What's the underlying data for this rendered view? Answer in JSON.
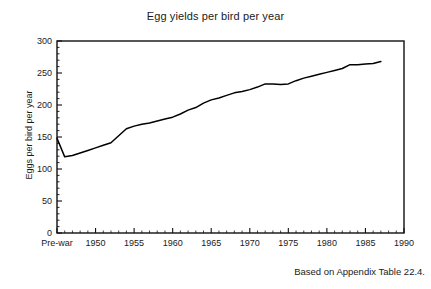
{
  "chart_data": {
    "type": "line",
    "title": "Egg yields per bird per year",
    "xlabel": "",
    "ylabel": "Eggs per bird per year",
    "source_note": "Based on Appendix Table 22.4.",
    "xlim": [
      1945,
      1990
    ],
    "ylim": [
      0,
      300
    ],
    "y_ticks": [
      0,
      50,
      100,
      150,
      200,
      250,
      300
    ],
    "y_minor_tick_step": 10,
    "x_ticks": [
      1945,
      1950,
      1955,
      1960,
      1965,
      1970,
      1975,
      1980,
      1985,
      1990
    ],
    "x_tick_labels": [
      "Pre-war",
      "1950",
      "1955",
      "1960",
      "1965",
      "1970",
      "1975",
      "1980",
      "1985",
      "1990"
    ],
    "x_minor_tick_step": 1,
    "grid": false,
    "legend": false,
    "series": [
      {
        "name": "Egg yield",
        "color": "#000000",
        "x": [
          1945,
          1946,
          1947,
          1948,
          1949,
          1950,
          1951,
          1952,
          1953,
          1954,
          1955,
          1956,
          1957,
          1958,
          1959,
          1960,
          1961,
          1962,
          1963,
          1964,
          1965,
          1966,
          1967,
          1968,
          1969,
          1970,
          1971,
          1972,
          1973,
          1974,
          1975,
          1976,
          1977,
          1978,
          1979,
          1980,
          1981,
          1982,
          1983,
          1984,
          1985,
          1986,
          1987
        ],
        "values": [
          148,
          119,
          121,
          125,
          129,
          133,
          137,
          141,
          152,
          163,
          167,
          170,
          172,
          175,
          178,
          181,
          186,
          192,
          196,
          203,
          208,
          211,
          215,
          219,
          221,
          224,
          228,
          233,
          233,
          232,
          233,
          238,
          242,
          245,
          248,
          251,
          254,
          257,
          263,
          263,
          264,
          265,
          268
        ]
      }
    ]
  },
  "labels": {
    "y_tick_0": "0",
    "y_tick_50": "50",
    "y_tick_100": "100",
    "y_tick_150": "150",
    "y_tick_200": "200",
    "y_tick_250": "250",
    "y_tick_300": "300"
  },
  "colors": {
    "line": "#000000",
    "axis": "#111111",
    "text": "#1a1a1a",
    "background": "#ffffff"
  }
}
